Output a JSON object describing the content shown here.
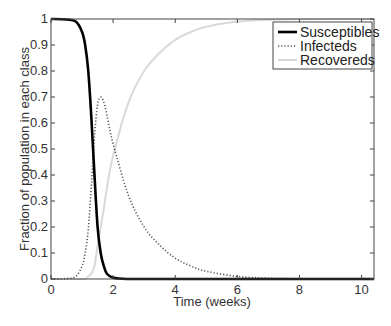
{
  "chart_data": {
    "type": "line",
    "title": "",
    "xlabel": "Time (weeks)",
    "ylabel": "Fraction of population in each class",
    "xlim": [
      0,
      10.4
    ],
    "ylim": [
      0,
      1
    ],
    "grid": false,
    "legend_position": "upper right",
    "xticks": [
      0,
      2,
      4,
      6,
      8,
      10
    ],
    "yticks": [
      0,
      0.1,
      0.2,
      0.3,
      0.4,
      0.5,
      0.6,
      0.7,
      0.8,
      0.9,
      1
    ],
    "xtick_labels": [
      "0",
      "2",
      "4",
      "6",
      "8",
      "10"
    ],
    "ytick_labels": [
      "0",
      "0.1",
      "0.2",
      "0.3",
      "0.4",
      "0.5",
      "0.6",
      "0.7",
      "0.8",
      "0.9",
      "1"
    ],
    "x": [
      0,
      0.5,
      0.8,
      1.0,
      1.1,
      1.2,
      1.3,
      1.4,
      1.5,
      1.6,
      1.7,
      1.8,
      2.0,
      2.5,
      3.0,
      3.5,
      4.0,
      4.5,
      5.0,
      6.0,
      7.0,
      8.0,
      10.4
    ],
    "series": [
      {
        "name": "Susceptibles",
        "style": "solid",
        "color": "#000000",
        "values": [
          1.0,
          0.998,
          0.99,
          0.95,
          0.9,
          0.8,
          0.62,
          0.4,
          0.2,
          0.1,
          0.05,
          0.02,
          0.005,
          0.0,
          0,
          0,
          0,
          0,
          0,
          0,
          0,
          0,
          0
        ]
      },
      {
        "name": "Infecteds",
        "style": "dotted",
        "color": "#555555",
        "values": [
          0.0,
          0.002,
          0.01,
          0.05,
          0.1,
          0.19,
          0.36,
          0.55,
          0.67,
          0.7,
          0.68,
          0.63,
          0.52,
          0.32,
          0.2,
          0.13,
          0.08,
          0.05,
          0.03,
          0.01,
          0.003,
          0.001,
          0.0
        ]
      },
      {
        "name": "Recovereds",
        "style": "solid",
        "color": "#d9d9d9",
        "values": [
          0.0,
          0.0,
          0.0,
          0.0,
          0.0,
          0.01,
          0.02,
          0.05,
          0.13,
          0.2,
          0.27,
          0.35,
          0.475,
          0.68,
          0.8,
          0.87,
          0.92,
          0.95,
          0.97,
          0.99,
          0.997,
          0.999,
          1.0
        ]
      }
    ]
  }
}
